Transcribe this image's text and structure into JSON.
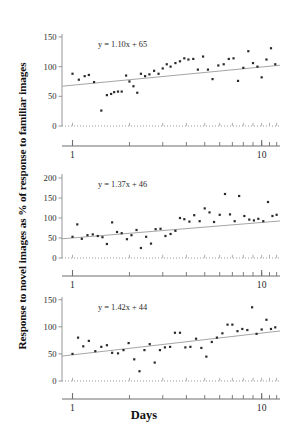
{
  "figure": {
    "ylabel": "Response to novel images as % of response to familiar images",
    "xlabel": "Days"
  },
  "chart_data": [
    {
      "type": "scatter",
      "panel": 1,
      "title": "",
      "xlabel": "Days",
      "ylabel": "Response to novel images as % of response to familiar images",
      "xscale": "log",
      "xlim": [
        0.88,
        12.5
      ],
      "ylim": [
        0,
        155
      ],
      "xticks": [
        1,
        10
      ],
      "xtick_labels": [
        "1",
        "10"
      ],
      "yticks": [
        0,
        50,
        100,
        150
      ],
      "ytick_labels": [
        "0",
        "50",
        "100",
        "150"
      ],
      "grid": false,
      "annotation": "y = 1.10x + 65",
      "fit": {
        "slope": 1.1,
        "intercept": 65,
        "label": "y = 1.10x + 65"
      },
      "x": [
        1.0,
        1.08,
        1.16,
        1.22,
        1.3,
        1.42,
        1.52,
        1.6,
        1.66,
        1.74,
        1.82,
        1.92,
        2.0,
        2.1,
        2.2,
        2.3,
        2.42,
        2.55,
        2.7,
        2.85,
        3.0,
        3.15,
        3.3,
        3.5,
        3.7,
        3.9,
        4.1,
        4.35,
        4.6,
        4.9,
        5.2,
        5.5,
        5.9,
        6.3,
        6.7,
        7.1,
        7.5,
        8.0,
        8.5,
        9.0,
        9.5,
        10.0,
        10.6,
        11.2,
        11.8
      ],
      "y": [
        88,
        78,
        84,
        86,
        74,
        26,
        52,
        54,
        57,
        58,
        58,
        85,
        75,
        67,
        56,
        88,
        84,
        87,
        93,
        88,
        97,
        104,
        100,
        106,
        109,
        114,
        112,
        113,
        95,
        117,
        95,
        79,
        102,
        104,
        113,
        114,
        76,
        98,
        126,
        106,
        100,
        82,
        112,
        131,
        104,
        98,
        113
      ]
    },
    {
      "type": "scatter",
      "panel": 2,
      "title": "",
      "xlabel": "Days",
      "ylabel": "Response to novel images as % of response to familiar images",
      "xscale": "log",
      "xlim": [
        0.88,
        12.5
      ],
      "ylim": [
        0,
        210
      ],
      "xticks": [
        1,
        10
      ],
      "xtick_labels": [
        "1",
        "10"
      ],
      "yticks": [
        0,
        50,
        100,
        150,
        200
      ],
      "ytick_labels": [
        "0",
        "50",
        "100",
        "150",
        "200"
      ],
      "grid": false,
      "annotation": "y = 1.37x + 46",
      "fit": {
        "slope": 1.37,
        "intercept": 46,
        "label": "y = 1.37x + 46"
      },
      "x": [
        1.0,
        1.06,
        1.12,
        1.2,
        1.28,
        1.36,
        1.44,
        1.52,
        1.62,
        1.72,
        1.82,
        1.94,
        2.05,
        2.18,
        2.3,
        2.45,
        2.6,
        2.75,
        2.92,
        3.1,
        3.3,
        3.5,
        3.7,
        3.9,
        4.15,
        4.4,
        4.7,
        5.0,
        5.3,
        5.6,
        6.0,
        6.4,
        6.8,
        7.2,
        7.6,
        8.1,
        8.6,
        9.1,
        9.6,
        10.2,
        10.8,
        11.4,
        12.0
      ],
      "y": [
        53,
        84,
        48,
        57,
        59,
        55,
        52,
        35,
        89,
        65,
        62,
        47,
        57,
        70,
        25,
        53,
        36,
        72,
        73,
        55,
        60,
        68,
        100,
        97,
        91,
        107,
        92,
        124,
        114,
        90,
        108,
        160,
        109,
        92,
        155,
        105,
        96,
        94,
        98,
        92,
        140,
        105,
        108,
        104,
        102,
        97,
        88
      ]
    },
    {
      "type": "scatter",
      "panel": 3,
      "title": "",
      "xlabel": "Days",
      "ylabel": "Response to novel images as % of response to familiar images",
      "xscale": "log",
      "xlim": [
        0.88,
        12.5
      ],
      "ylim": [
        0,
        155
      ],
      "xticks": [
        1,
        10
      ],
      "xtick_labels": [
        "1",
        "10"
      ],
      "yticks": [
        0,
        50,
        100,
        150
      ],
      "ytick_labels": [
        "0",
        "50",
        "100",
        "150"
      ],
      "grid": false,
      "annotation": "y = 1.42x + 44",
      "fit": {
        "slope": 1.42,
        "intercept": 44,
        "label": "y = 1.42x + 44"
      },
      "x": [
        1.0,
        1.07,
        1.14,
        1.22,
        1.32,
        1.42,
        1.52,
        1.62,
        1.74,
        1.86,
        1.98,
        2.12,
        2.26,
        2.4,
        2.56,
        2.72,
        2.9,
        3.08,
        3.28,
        3.48,
        3.7,
        3.95,
        4.2,
        4.5,
        4.8,
        5.1,
        5.45,
        5.8,
        6.2,
        6.6,
        7.0,
        7.45,
        7.9,
        8.4,
        8.9,
        9.4,
        10.0,
        10.6,
        11.2,
        11.8
      ],
      "y": [
        50,
        80,
        64,
        74,
        55,
        63,
        66,
        52,
        51,
        57,
        70,
        40,
        18,
        57,
        68,
        34,
        57,
        62,
        63,
        89,
        89,
        62,
        63,
        78,
        61,
        45,
        72,
        80,
        88,
        104,
        104,
        92,
        96,
        94,
        136,
        87,
        95,
        113,
        96,
        99,
        100
      ]
    }
  ]
}
